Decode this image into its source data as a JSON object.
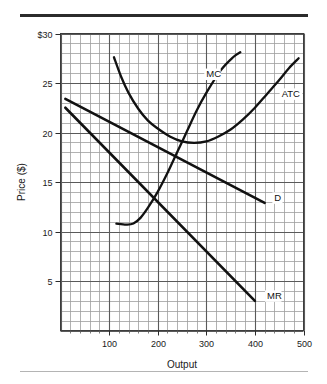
{
  "figure": {
    "name": "monopoly-cost-revenue-diagram",
    "top_rule_color": "#2b2b2b",
    "bottom_rule_color": "#b4b4b4",
    "background": "#ffffff",
    "curve_color": "#111111",
    "grid_major_color": "#5a5a5a",
    "grid_minor_color": "#9e9e9e"
  },
  "chart_data": {
    "type": "line",
    "title": "",
    "xlabel": "Output",
    "ylabel": "Price ($)",
    "xlim": [
      0,
      500
    ],
    "ylim": [
      0,
      30
    ],
    "grid": true,
    "grid_major_x_step": 100,
    "grid_minor_x_step": 20,
    "grid_major_y_step": 5,
    "grid_minor_y_step": 1,
    "legend_position": "inline-curve-labels",
    "xticks": [
      100,
      200,
      300,
      400,
      500
    ],
    "xticklabels": [
      "100",
      "200",
      "300",
      "400",
      "500"
    ],
    "yticks": [
      5,
      10,
      15,
      20,
      25,
      30
    ],
    "yticklabels": [
      "5",
      "10",
      "15",
      "20",
      "25",
      "$30"
    ],
    "series": [
      {
        "name": "MC",
        "label": "MC",
        "kind": "curve",
        "label_x": 300,
        "label_y": 25.6,
        "points": [
          [
            115,
            10.8
          ],
          [
            135,
            10.7
          ],
          [
            150,
            10.8
          ],
          [
            165,
            11.4
          ],
          [
            180,
            12.4
          ],
          [
            200,
            14.0
          ],
          [
            220,
            15.9
          ],
          [
            240,
            18.0
          ],
          [
            260,
            20.1
          ],
          [
            280,
            22.2
          ],
          [
            300,
            24.0
          ],
          [
            330,
            26.3
          ],
          [
            355,
            27.6
          ],
          [
            370,
            28.1
          ]
        ]
      },
      {
        "name": "ATC",
        "label": "ATC",
        "kind": "curve",
        "label_x": 455,
        "label_y": 23.6,
        "points": [
          [
            110,
            27.6
          ],
          [
            125,
            25.6
          ],
          [
            140,
            24.0
          ],
          [
            160,
            22.4
          ],
          [
            180,
            21.2
          ],
          [
            200,
            20.4
          ],
          [
            225,
            19.6
          ],
          [
            250,
            19.1
          ],
          [
            275,
            18.95
          ],
          [
            300,
            19.1
          ],
          [
            325,
            19.6
          ],
          [
            350,
            20.3
          ],
          [
            375,
            21.3
          ],
          [
            400,
            22.5
          ],
          [
            425,
            23.9
          ],
          [
            450,
            25.3
          ],
          [
            470,
            26.5
          ],
          [
            490,
            27.5
          ]
        ]
      },
      {
        "name": "D",
        "label": "D",
        "kind": "line",
        "label_x": 440,
        "label_y": 13.1,
        "points": [
          [
            10,
            23.4
          ],
          [
            420,
            12.9
          ]
        ]
      },
      {
        "name": "MR",
        "label": "MR",
        "kind": "line",
        "label_x": 425,
        "label_y": 3.2,
        "points": [
          [
            10,
            22.5
          ],
          [
            400,
            3.0
          ]
        ]
      }
    ],
    "annotations": []
  }
}
